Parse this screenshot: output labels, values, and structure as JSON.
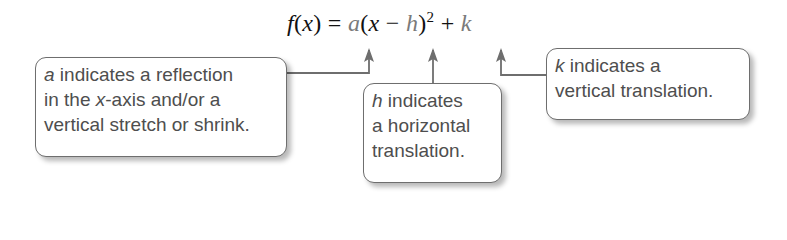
{
  "formula": {
    "f": "f",
    "open": "(",
    "x": "x",
    "close_eq": ") = ",
    "a": "a",
    "paren_open": "(",
    "x2": "x",
    "minus": " − ",
    "h": "h",
    "paren_close": ")",
    "exponent": "2",
    "plus": " + ",
    "k": "k"
  },
  "callouts": [
    {
      "variable": "a",
      "lines": [
        " indicates a reflection",
        "in the ",
        "x",
        "-axis and/or a",
        "vertical stretch or shrink."
      ]
    },
    {
      "variable": "h",
      "lines": [
        " indicates",
        "a horizontal",
        "translation."
      ]
    },
    {
      "variable": "k",
      "lines": [
        " indicates a",
        "vertical translation."
      ]
    }
  ],
  "colors": {
    "variable": "#7a7a7a",
    "box_border": "#6e6e6e",
    "box_text": "#4e4e4e",
    "arrow": "#6e6e6e"
  }
}
